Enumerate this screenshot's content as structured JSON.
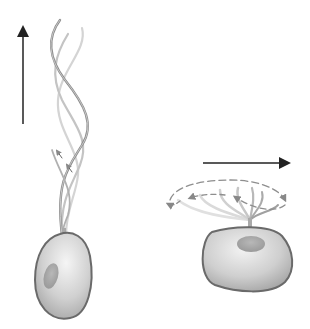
{
  "diagram": {
    "type": "illustration",
    "panels": [
      {
        "id": "left",
        "description": "Cell with helical flagellum; wave propagates, cell moves along flagellum axis",
        "direction_arrow": "up",
        "icons": [
          "up-arrow-icon",
          "helical-flagellum",
          "cell-body"
        ]
      },
      {
        "id": "right",
        "description": "Cell with beating flagellum sweeping in a circular stroke; cell moves sideways",
        "direction_arrow": "right",
        "icons": [
          "right-arrow-icon",
          "rotary-flagellum",
          "cell-body"
        ]
      }
    ],
    "colors": {
      "arrow": "#222222",
      "flagellum_dark": "#8a8a8a",
      "flagellum_light": "#c8c8c8",
      "cell_fill": "#d4d4d4",
      "cell_outline": "#6a6a6a",
      "stroke_path": "#9a9a9a"
    }
  }
}
